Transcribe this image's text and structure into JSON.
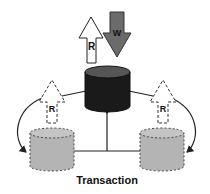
{
  "diagram": {
    "caption": "Transaction",
    "arrows": {
      "read_primary": "R",
      "write_primary": "W",
      "read_replica_left": "R",
      "read_replica_right": "R"
    },
    "colors": {
      "primary_db": "#1a1a1a",
      "write_arrow": "#6b6b6b",
      "read_arrow": "#ffffff",
      "replica_db": "#b4b4b4",
      "line": "#222222"
    }
  }
}
